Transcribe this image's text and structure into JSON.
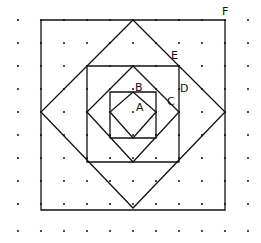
{
  "diagram": {
    "type": "nested squares on dot grid",
    "grid": {
      "x0": 18,
      "y0": 20,
      "spacing": 23,
      "cols": 11,
      "rows": 10
    },
    "labels": [
      {
        "text": "A",
        "x": 136,
        "y": 102
      },
      {
        "text": "B",
        "x": 135,
        "y": 82
      },
      {
        "text": "C",
        "x": 167,
        "y": 96
      },
      {
        "text": "D",
        "x": 180,
        "y": 83
      },
      {
        "text": "E",
        "x": 171,
        "y": 50
      },
      {
        "text": "F",
        "x": 222,
        "y": 6
      }
    ],
    "shapes": [
      {
        "name": "square-F",
        "points": [
          [
            41,
            20
          ],
          [
            225,
            20
          ],
          [
            225,
            210
          ],
          [
            41,
            210
          ]
        ]
      },
      {
        "name": "diamond-E",
        "points": [
          [
            133,
            20
          ],
          [
            225,
            112
          ],
          [
            133,
            208
          ],
          [
            41,
            112
          ]
        ]
      },
      {
        "name": "square-D",
        "points": [
          [
            87,
            66
          ],
          [
            179,
            66
          ],
          [
            179,
            162
          ],
          [
            87,
            162
          ]
        ]
      },
      {
        "name": "diamond-C",
        "points": [
          [
            133,
            66
          ],
          [
            179,
            112
          ],
          [
            133,
            162
          ],
          [
            87,
            112
          ]
        ]
      },
      {
        "name": "square-B",
        "points": [
          [
            110,
            92
          ],
          [
            156,
            92
          ],
          [
            156,
            138
          ],
          [
            110,
            138
          ]
        ]
      },
      {
        "name": "diamond-A",
        "points": [
          [
            133,
            92
          ],
          [
            156,
            112
          ],
          [
            133,
            138
          ],
          [
            110,
            112
          ]
        ]
      }
    ]
  }
}
